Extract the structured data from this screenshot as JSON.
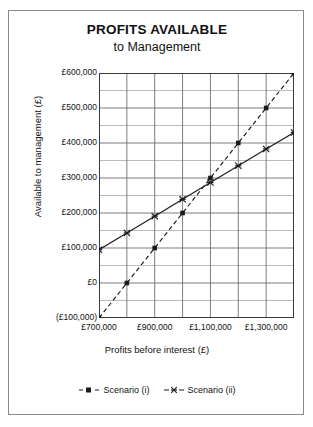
{
  "chart_data": {
    "type": "line",
    "title": "PROFITS AVAILABLE",
    "subtitle": "to Management",
    "xlabel": "Profits before interest (£)",
    "ylabel": "Available to management (£)",
    "xlim": [
      700000,
      1400000
    ],
    "ylim": [
      -100000,
      600000
    ],
    "grid": true,
    "legend_position": "bottom",
    "x_major_step": 200000,
    "x_minor_step": 100000,
    "y_major_step": 100000,
    "y_minor_step": 50000,
    "xticks": [
      700000,
      900000,
      1100000,
      1300000
    ],
    "xticklabels": [
      "£700,000",
      "£900,000",
      "£1,100,000",
      "£1,300,000"
    ],
    "yticks": [
      600000,
      500000,
      400000,
      300000,
      200000,
      100000,
      0,
      -100000
    ],
    "yticklabels": [
      "£600,000",
      "£500,000",
      "£400,000",
      "£300,000",
      "£200,000",
      "£100,000",
      "£0",
      "(£100,000)"
    ],
    "series": [
      {
        "name": "Scenario (i)",
        "marker": "square",
        "linestyle": "dashed",
        "color": "#1a1a1a",
        "x": [
          700000,
          800000,
          900000,
          1000000,
          1100000,
          1200000,
          1300000,
          1400000
        ],
        "values": [
          -100000,
          0,
          100000,
          200000,
          300000,
          400000,
          500000,
          600000
        ]
      },
      {
        "name": "Scenario (ii)",
        "marker": "x",
        "linestyle": "solid",
        "color": "#1a1a1a",
        "x": [
          700000,
          800000,
          900000,
          1000000,
          1100000,
          1200000,
          1300000,
          1400000
        ],
        "values": [
          95000,
          143000,
          191000,
          239000,
          287000,
          335000,
          383000,
          430000
        ]
      }
    ]
  },
  "legend": {
    "items": [
      {
        "label": "Scenario (i)"
      },
      {
        "label": "Scenario (ii)"
      }
    ]
  }
}
